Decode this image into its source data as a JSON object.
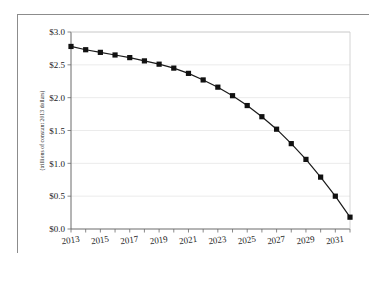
{
  "chart_data": {
    "type": "line",
    "title": "",
    "subtitle": "",
    "xlabel": "",
    "ylabel": "(trillions of constant 2013 dollars)",
    "x": [
      2013,
      2014,
      2015,
      2016,
      2017,
      2018,
      2019,
      2020,
      2021,
      2022,
      2023,
      2024,
      2025,
      2026,
      2027,
      2028,
      2029,
      2030,
      2031,
      2032
    ],
    "series": [
      {
        "name": "",
        "values": [
          2.78,
          2.73,
          2.69,
          2.65,
          2.61,
          2.56,
          2.51,
          2.45,
          2.37,
          2.27,
          2.16,
          2.03,
          1.88,
          1.71,
          1.52,
          1.3,
          1.06,
          0.79,
          0.5,
          0.18
        ]
      }
    ],
    "xlim": [
      2013,
      2032
    ],
    "ylim": [
      0.0,
      3.0
    ],
    "ytick_values": [
      0.0,
      0.5,
      1.0,
      1.5,
      2.0,
      2.5,
      3.0
    ],
    "ytick_labels": [
      "$0.0",
      "$0.5",
      "$1.0",
      "$1.5",
      "$2.0",
      "$2.5",
      "$3.0"
    ],
    "xtick_values": [
      2013,
      2015,
      2017,
      2019,
      2021,
      2023,
      2025,
      2027,
      2029,
      2031
    ],
    "xtick_labels": [
      "2013",
      "2015",
      "2017",
      "2019",
      "2021",
      "2023",
      "2025",
      "2027",
      "2029",
      "2031"
    ],
    "xminor_ticks": [
      2013,
      2014,
      2015,
      2016,
      2017,
      2018,
      2019,
      2020,
      2021,
      2022,
      2023,
      2024,
      2025,
      2026,
      2027,
      2028,
      2029,
      2030,
      2031,
      2032
    ],
    "grid": "horizontal",
    "legend": "none",
    "marker": "square",
    "colors": {
      "line": "#1a1a1a",
      "marker": "#111111",
      "gridline": "#e2e2e2",
      "axis": "#6b6b6b",
      "frame": "#8c8c8c",
      "background": "#ffffff"
    }
  }
}
